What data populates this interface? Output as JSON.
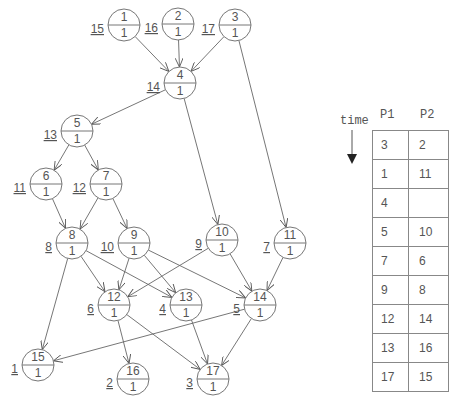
{
  "graph": {
    "nodes": [
      {
        "id": "1",
        "weight": "1",
        "priority": "15",
        "x": 124,
        "y": 25
      },
      {
        "id": "2",
        "weight": "1",
        "priority": "16",
        "x": 178,
        "y": 24
      },
      {
        "id": "3",
        "weight": "1",
        "priority": "17",
        "x": 235,
        "y": 25
      },
      {
        "id": "4",
        "weight": "1",
        "priority": "14",
        "x": 180,
        "y": 83
      },
      {
        "id": "5",
        "weight": "1",
        "priority": "13",
        "x": 77,
        "y": 131
      },
      {
        "id": "6",
        "weight": "1",
        "priority": "11",
        "x": 46,
        "y": 184
      },
      {
        "id": "7",
        "weight": "1",
        "priority": "12",
        "x": 106,
        "y": 184
      },
      {
        "id": "8",
        "weight": "1",
        "priority": "8",
        "x": 72,
        "y": 243
      },
      {
        "id": "9",
        "weight": "1",
        "priority": "10",
        "x": 134,
        "y": 243
      },
      {
        "id": "10",
        "weight": "1",
        "priority": "9",
        "x": 222,
        "y": 240
      },
      {
        "id": "11",
        "weight": "1",
        "priority": "7",
        "x": 290,
        "y": 243
      },
      {
        "id": "12",
        "weight": "1",
        "priority": "6",
        "x": 114,
        "y": 305
      },
      {
        "id": "13",
        "weight": "1",
        "priority": "4",
        "x": 186,
        "y": 305
      },
      {
        "id": "14",
        "weight": "1",
        "priority": "5",
        "x": 260,
        "y": 305
      },
      {
        "id": "15",
        "weight": "1",
        "priority": "1",
        "x": 38,
        "y": 365
      },
      {
        "id": "16",
        "weight": "1",
        "priority": "2",
        "x": 133,
        "y": 379
      },
      {
        "id": "17",
        "weight": "1",
        "priority": "3",
        "x": 213,
        "y": 379
      }
    ],
    "edges": [
      [
        "1",
        "4"
      ],
      [
        "2",
        "4"
      ],
      [
        "3",
        "4"
      ],
      [
        "3",
        "11"
      ],
      [
        "4",
        "5"
      ],
      [
        "4",
        "10"
      ],
      [
        "5",
        "6"
      ],
      [
        "5",
        "7"
      ],
      [
        "6",
        "8"
      ],
      [
        "7",
        "8"
      ],
      [
        "7",
        "9"
      ],
      [
        "8",
        "15"
      ],
      [
        "8",
        "12"
      ],
      [
        "8",
        "13"
      ],
      [
        "9",
        "12"
      ],
      [
        "9",
        "13"
      ],
      [
        "9",
        "14"
      ],
      [
        "10",
        "12"
      ],
      [
        "10",
        "14"
      ],
      [
        "11",
        "14"
      ],
      [
        "12",
        "16"
      ],
      [
        "12",
        "17"
      ],
      [
        "13",
        "17"
      ],
      [
        "14",
        "15"
      ],
      [
        "14",
        "17"
      ]
    ]
  },
  "schedule": {
    "time_label": "time",
    "columns": [
      "P1",
      "P2"
    ],
    "rows": [
      [
        "3",
        "2"
      ],
      [
        "1",
        "11"
      ],
      [
        "4",
        ""
      ],
      [
        "5",
        "10"
      ],
      [
        "7",
        "6"
      ],
      [
        "9",
        "8"
      ],
      [
        "12",
        "14"
      ],
      [
        "13",
        "16"
      ],
      [
        "17",
        "15"
      ]
    ]
  }
}
